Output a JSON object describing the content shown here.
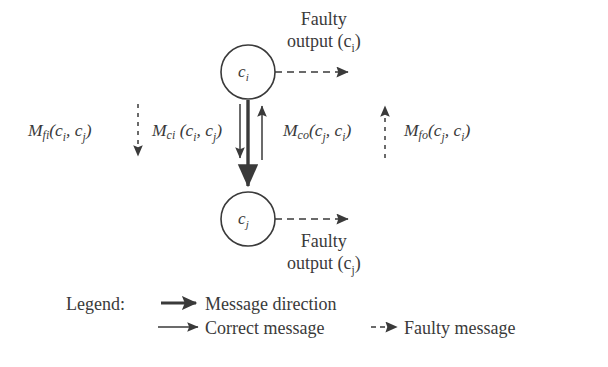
{
  "diagram": {
    "background_color": "#ffffff",
    "ink_color": "#3a3a3a",
    "nodes": [
      {
        "id": "ci",
        "label_base": "c",
        "label_sub": "i",
        "cx": 248,
        "cy": 72,
        "r": 27
      },
      {
        "id": "cj",
        "label_base": "c",
        "label_sub": "j",
        "cx": 248,
        "cy": 219,
        "r": 27
      }
    ],
    "captions": [
      {
        "id": "faulty-output-ci",
        "line1": "Faulty",
        "line2_base": "output (c",
        "line2_sub": "i",
        "line2_tail": ")"
      },
      {
        "id": "faulty-output-cj",
        "line1": "Faulty",
        "line2_base": "output (c",
        "line2_sub": "j",
        "line2_tail": ")"
      }
    ],
    "message_labels": [
      {
        "id": "m-fi",
        "base": "M",
        "sub": "fi",
        "args": "(c",
        "arg1_sub": "i",
        "mid": ", c",
        "arg2_sub": "j",
        "tail": ")",
        "kind": "faulty-input",
        "arrow": "dashed-down"
      },
      {
        "id": "m-ci",
        "base": "M",
        "sub": "ci",
        "args": " (c",
        "arg1_sub": "i",
        "mid": ", c",
        "arg2_sub": "j",
        "tail": ")",
        "kind": "correct-input",
        "arrow": "solid-down"
      },
      {
        "id": "m-co",
        "base": "M",
        "sub": "co",
        "args": "(c",
        "arg1_sub": "j",
        "mid": ", c",
        "arg2_sub": "i",
        "tail": ")",
        "kind": "correct-output",
        "arrow": "solid-up"
      },
      {
        "id": "m-fo",
        "base": "M",
        "sub": "fo",
        "args": "(c",
        "arg1_sub": "j",
        "mid": ", c",
        "arg2_sub": "i",
        "tail": ")",
        "kind": "faulty-output",
        "arrow": "dashed-up"
      }
    ],
    "legend": {
      "title": "Legend:",
      "entries": [
        {
          "id": "message-direction",
          "label": "Message direction",
          "style": "thick-solid-arrow"
        },
        {
          "id": "correct-message",
          "label": "Correct message",
          "style": "thin-solid-arrow"
        },
        {
          "id": "faulty-message",
          "label": "Faulty message",
          "style": "thin-dashed-arrow"
        }
      ]
    }
  }
}
